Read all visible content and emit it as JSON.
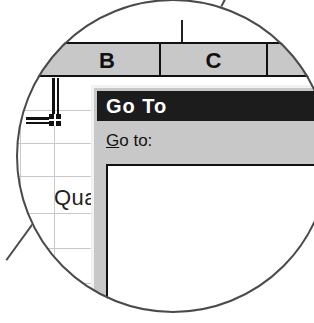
{
  "figure": {
    "type": "magnified-screenshot-callout",
    "shape": "circle",
    "leader_lines": 2
  },
  "spreadsheet": {
    "column_headers": [
      {
        "label": "B",
        "name": "column-header-b"
      },
      {
        "label": "C",
        "name": "column-header-c"
      },
      {
        "label": "",
        "name": "column-header-d"
      }
    ],
    "cells": [
      {
        "text": "Qua",
        "truncated": true,
        "name": "cell-text-qua"
      }
    ],
    "selection": {
      "fill_handle_visible": true,
      "border_color": "#111111"
    },
    "grid_line_color": "#c9c9c9",
    "header_fill": "#c8c8c8"
  },
  "dialog": {
    "title": "Go To",
    "title_bar_color": "#1c1c1c",
    "title_text_color": "#ffffff",
    "face_color": "#c8c8c8",
    "label": {
      "accelerator": "G",
      "rest": "o to:",
      "full": "Go to:"
    },
    "listbox": {
      "items": [],
      "background": "#ffffff",
      "border_color": "#111111"
    }
  }
}
